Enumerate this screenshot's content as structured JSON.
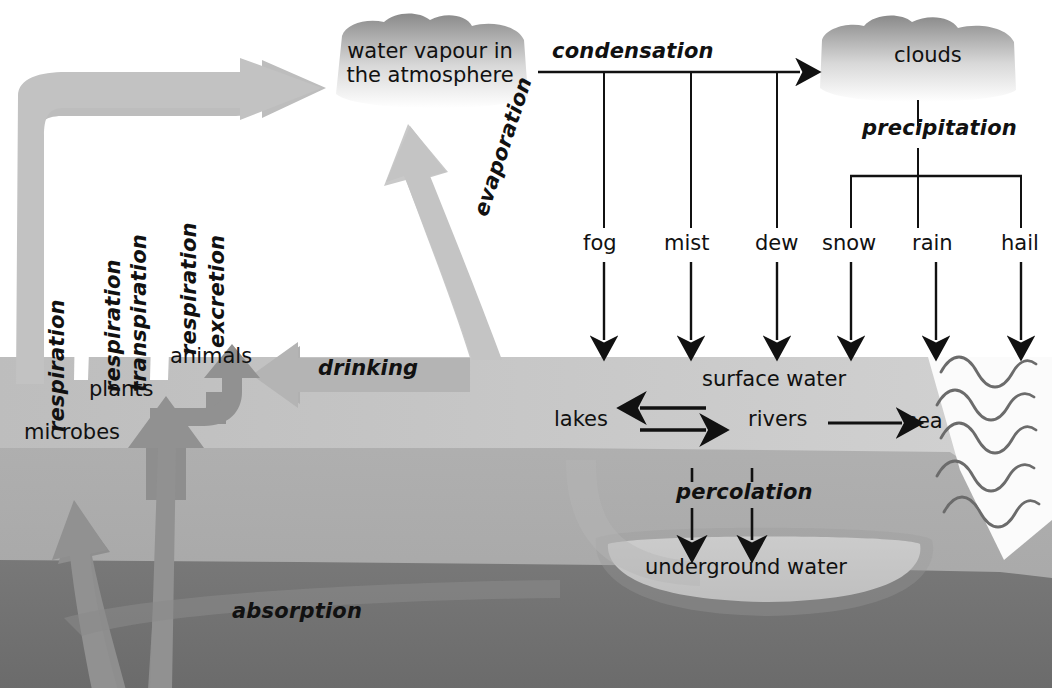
{
  "diagram": {
    "type": "water-cycle-diagram"
  },
  "atmosphere": {
    "water_vapour_line1": "water vapour in",
    "water_vapour_line2": "the atmosphere",
    "clouds": "clouds"
  },
  "processes": {
    "condensation": "condensation",
    "precipitation": "precipitation",
    "evaporation": "evaporation",
    "drinking": "drinking",
    "percolation": "percolation",
    "absorption": "absorption"
  },
  "condensation_forms": [
    {
      "label": "fog"
    },
    {
      "label": "mist"
    },
    {
      "label": "dew"
    }
  ],
  "precipitation_forms": [
    {
      "label": "snow"
    },
    {
      "label": "rain"
    },
    {
      "label": "hail"
    }
  ],
  "surface": {
    "surface_water": "surface water",
    "lakes": "lakes",
    "rivers": "rivers",
    "sea": "sea"
  },
  "underground": {
    "underground_water": "underground water"
  },
  "biosphere": {
    "microbes": "microbes",
    "plants": "plants",
    "animals": "animals",
    "respiration_microbes": "respiration",
    "respiration_plants": "respiration",
    "transpiration_plants": "transpiration",
    "respiration_animals": "respiration",
    "excretion_animals": "excretion"
  },
  "colors": {
    "ink": "#111111",
    "cloud_dark": "#8b8b8b",
    "cloud_light": "#ffffff",
    "flow_arrow": "#b9b9b9",
    "absorb_arrow": "#8e8e8e",
    "ground_top": "#c0c0c0",
    "ground_mid": "#ababab",
    "ground_deep": "#6f6f6f",
    "underground_basin": "#dcdcdc",
    "wave": "#6b6b6b"
  }
}
